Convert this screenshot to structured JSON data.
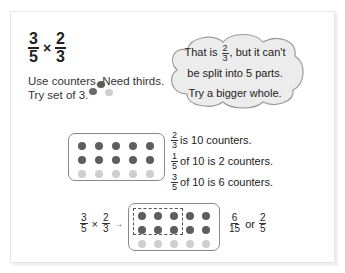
{
  "title": {
    "left_fraction": {
      "numerator": "3",
      "denominator": "5"
    },
    "operator": "×",
    "right_fraction": {
      "numerator": "2",
      "denominator": "3"
    }
  },
  "instructions": {
    "line1": "Use counters. Need thirds.",
    "line2": "Try set of 3."
  },
  "thought_bubble": {
    "line1_prefix": "That is",
    "line1_fraction": {
      "numerator": "2",
      "denominator": "3"
    },
    "line1_suffix": ", but it can't",
    "line2": "be split into 5 parts.",
    "line3": "Try a bigger whole."
  },
  "counter_tray": {
    "columns": 5,
    "rows": [
      {
        "shade": "dark"
      },
      {
        "shade": "dark"
      },
      {
        "shade": "light"
      }
    ]
  },
  "facts": [
    {
      "fraction": {
        "numerator": "2",
        "denominator": "3"
      },
      "text": "is 10 counters."
    },
    {
      "fraction": {
        "numerator": "1",
        "denominator": "5"
      },
      "text": "of 10 is 2 counters."
    },
    {
      "fraction": {
        "numerator": "3",
        "denominator": "5"
      },
      "text": "of 10 is 6 counters."
    }
  ],
  "equation": {
    "left_fraction": {
      "numerator": "3",
      "denominator": "5"
    },
    "operator": "×",
    "right_fraction": {
      "numerator": "2",
      "denominator": "3"
    },
    "arrow": "→",
    "result_fraction": {
      "numerator": "6",
      "denominator": "15"
    },
    "connector": "or",
    "simplified_fraction": {
      "numerator": "2",
      "denominator": "5"
    }
  },
  "colors": {
    "dark_counter": "#5e5e5e",
    "light_counter": "#cfcfcf",
    "bubble_fill": "#ececec",
    "tray_border": "#888888"
  }
}
